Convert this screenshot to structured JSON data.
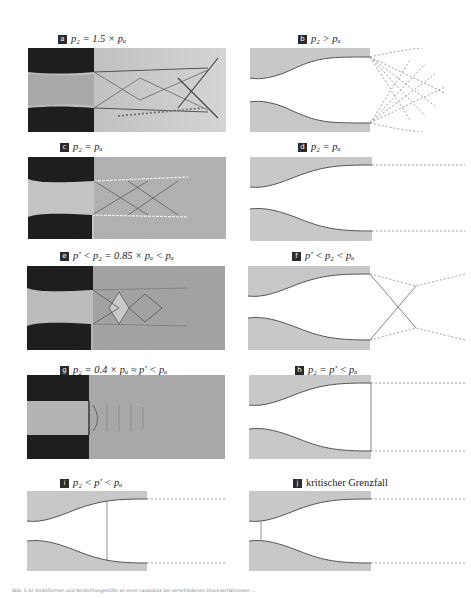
{
  "figure": {
    "panels": [
      {
        "id": "a",
        "badge": "a",
        "label": "p₂ = 1.5 × pₐ",
        "type": "schlieren-photo",
        "description": "overexpanded? underexpanded jet with diamond shock pattern"
      },
      {
        "id": "b",
        "badge": "b",
        "label": "p₂ > pₐ",
        "type": "schematic",
        "description": "underexpanded jet with expansion fans (dashed)"
      },
      {
        "id": "c",
        "badge": "c",
        "label": "p₂ = pₐ",
        "type": "schlieren-photo",
        "description": "adapted jet"
      },
      {
        "id": "d",
        "badge": "d",
        "label": "p₂ = pₐ",
        "type": "schematic",
        "description": "adapted jet with parallel dashed jet boundaries"
      },
      {
        "id": "e",
        "badge": "e",
        "label": "p′ < p₂ = 0.85 × pₐ < pₐ",
        "type": "schlieren-photo",
        "description": "overexpanded jet with oblique shocks"
      },
      {
        "id": "f",
        "badge": "f",
        "label": "p′ < p₂ < pₐ",
        "type": "schematic",
        "description": "crossing oblique shocks at nozzle exit"
      },
      {
        "id": "g",
        "badge": "g",
        "label": "p₂ = 0.4 × pₐ ≈ p′ < pₐ",
        "type": "schlieren-photo",
        "description": "normal shock at nozzle exit"
      },
      {
        "id": "h",
        "badge": "h",
        "label": "p₂ = p′ < pₐ",
        "type": "schematic",
        "description": "normal shock at exit plane"
      },
      {
        "id": "i",
        "badge": "i",
        "label": "p₂ < p′ < pₐ",
        "type": "schematic",
        "description": "normal shock inside divergent section"
      },
      {
        "id": "j",
        "badge": "j",
        "label": "kritischer Grenzfall",
        "type": "schematic",
        "description": "normal shock at throat"
      }
    ],
    "caption": "Abb. 5.32 Strahlformen und Verdichtungsstöße an einer Lavaldüse bei verschiedenen Druckverhältnissen ..."
  },
  "colors": {
    "wall_fill": "#c8c8c8",
    "wall_line": "#555555",
    "dashed": "#8a8a8a",
    "badge": "#2b2b2b",
    "photo_dark": "#1a1a1a",
    "photo_mid": "#9a9a9a"
  }
}
